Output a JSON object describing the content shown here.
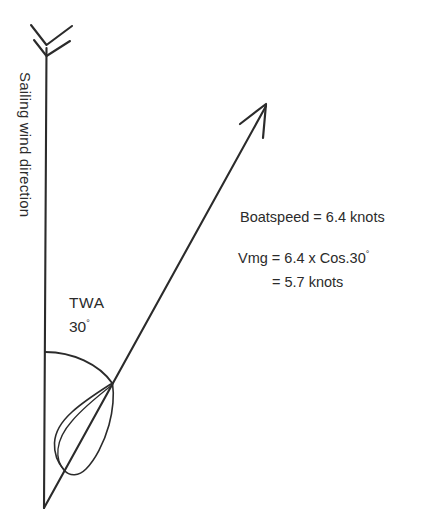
{
  "diagram": {
    "background_color": "#ffffff",
    "line_color": "#2b2b2b",
    "wind_arrow": {
      "label": "Sailing wind direction",
      "orientation": "vertical",
      "arrowhead": "double-chevron-feather",
      "points_downward": true
    },
    "twa": {
      "label": "TWA",
      "angle_text": "30",
      "degree_symbol": "°",
      "value_degrees": 30
    },
    "boat": {
      "shape": "teardrop-hull-outline",
      "heading_arrow": "open-barb-arrowhead"
    },
    "annotations": {
      "boatspeed": "Boatspeed = 6.4 knots",
      "vmg_formula": "Vmg = 6.4 x Cos.30",
      "vmg_result": "= 5.7 knots",
      "boatspeed_value": 6.4,
      "vmg_value": 5.7,
      "units": "knots"
    }
  }
}
